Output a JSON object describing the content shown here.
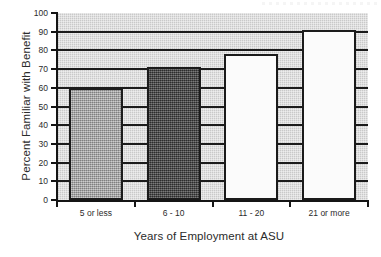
{
  "chart_data": {
    "type": "bar",
    "title": "",
    "subtitle": "",
    "xlabel": "Years of Employment at ASU",
    "ylabel": "Percent Familiar with Benefit",
    "categories": [
      "5 or less",
      "6 - 10",
      "11 - 20",
      "21 or more"
    ],
    "values": [
      60,
      71,
      78,
      91
    ],
    "series": [
      {
        "name": "Percent Familiar with Benefit",
        "values": [
          60,
          71,
          78,
          91
        ]
      }
    ],
    "ylim": [
      0,
      100
    ],
    "ytick_step": 10,
    "ytick_labels": [
      "0",
      "10",
      "20",
      "30",
      "40",
      "50",
      "60",
      "70",
      "80",
      "90",
      "100"
    ],
    "grid": true,
    "grid_axis": "y",
    "legend": false,
    "legend_position": "none",
    "bar_colors": [
      "#9d9d9d",
      "#474747",
      "#fbfbfb",
      "#fbfbfb"
    ],
    "bar_edge_color": "#1b1b1b",
    "plot_background": "#c9c9c9",
    "axis_color": "#151515",
    "text_color": "#2b2b2b",
    "figure_background": "#ffffff",
    "annotations": []
  },
  "axes": {
    "y_title": "Percent Familiar with Benefit",
    "x_title": "Years of Employment at ASU"
  },
  "y_ticks": [
    {
      "label": "100",
      "value": 100
    },
    {
      "label": "90",
      "value": 90
    },
    {
      "label": "80",
      "value": 80
    },
    {
      "label": "70",
      "value": 70
    },
    {
      "label": "60",
      "value": 60
    },
    {
      "label": "50",
      "value": 50
    },
    {
      "label": "40",
      "value": 40
    },
    {
      "label": "30",
      "value": 30
    },
    {
      "label": "20",
      "value": 20
    },
    {
      "label": "10",
      "value": 10
    },
    {
      "label": "0",
      "value": 0
    }
  ],
  "bars": [
    {
      "label": "5 or less",
      "value": 60,
      "style": "fill-medium-gray"
    },
    {
      "label": "6 - 10",
      "value": 71,
      "style": "fill-dark-gray"
    },
    {
      "label": "11 - 20",
      "value": 78,
      "style": "fill-white"
    },
    {
      "label": "21 or more",
      "value": 91,
      "style": "fill-white"
    }
  ]
}
